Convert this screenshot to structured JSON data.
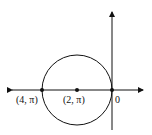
{
  "diagram": {
    "type": "polar-circle",
    "colors": {
      "stroke": "#111111",
      "background": "#ffffff"
    },
    "axes": {
      "horizontal": {
        "x1": 10,
        "x2": 145,
        "y": 90,
        "arrows": "both"
      },
      "vertical": {
        "x": 112,
        "y1": 10,
        "y2": 132,
        "arrows": "top"
      }
    },
    "circle": {
      "cx": 77,
      "cy": 90,
      "r": 35
    },
    "points": [
      {
        "label": "(4, π)",
        "x": 42,
        "y": 90
      },
      {
        "label": "(2, π)",
        "x": 77,
        "y": 90
      },
      {
        "label": "0",
        "x": 112,
        "y": 90
      }
    ]
  }
}
